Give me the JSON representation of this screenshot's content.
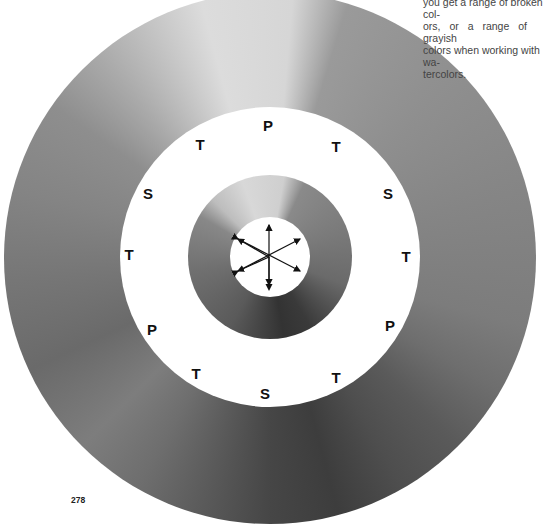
{
  "caption": {
    "lines": [
      "you get a range of broken col-",
      "ors, or a range of grayish",
      "colors when working with wa-",
      "tercolors."
    ],
    "visible_text": "you get a range of broken colors, or a range of grayish colors when working with watercolors."
  },
  "page_number": "278",
  "figure": {
    "labels": [
      {
        "text": "P",
        "x": 268,
        "y": 125
      },
      {
        "text": "T",
        "x": 336,
        "y": 146
      },
      {
        "text": "S",
        "x": 388,
        "y": 193
      },
      {
        "text": "T",
        "x": 406,
        "y": 256
      },
      {
        "text": "P",
        "x": 390,
        "y": 325
      },
      {
        "text": "T",
        "x": 336,
        "y": 377
      },
      {
        "text": "S",
        "x": 265,
        "y": 393
      },
      {
        "text": "T",
        "x": 196,
        "y": 373
      },
      {
        "text": "P",
        "x": 152,
        "y": 329
      },
      {
        "text": "T",
        "x": 129,
        "y": 254
      },
      {
        "text": "S",
        "x": 148,
        "y": 193
      },
      {
        "text": "T",
        "x": 200,
        "y": 144
      }
    ],
    "legend": {
      "P": "primary",
      "S": "secondary",
      "T": "tertiary"
    }
  }
}
